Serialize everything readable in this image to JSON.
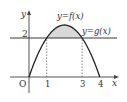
{
  "chart_data": {
    "type": "line",
    "title": "",
    "xlabel": "x",
    "ylabel": "y",
    "origin_label": "O",
    "x_ticks": [
      "1",
      "3",
      "4"
    ],
    "y_ticks": [
      "2"
    ],
    "xlim": [
      -1,
      4.6
    ],
    "ylim": [
      -0.8,
      3.4
    ],
    "series": [
      {
        "name": "y=f(x)",
        "label": "y=f(x)",
        "kind": "parabola",
        "formula": "f(x) = (2/3)x(4-x)",
        "x": [
          0,
          0.5,
          1,
          1.5,
          2,
          2.5,
          3,
          3.5,
          4
        ],
        "y": [
          0,
          1.1667,
          2,
          2.5,
          2.6667,
          2.5,
          2,
          1.1667,
          0
        ]
      },
      {
        "name": "y=g(x)",
        "label": "y=g(x)",
        "kind": "horizontal-line",
        "y_value": 2
      }
    ],
    "shaded_region": {
      "between": [
        "y=f(x)",
        "y=g(x)"
      ],
      "x_from": 1,
      "x_to": 3
    },
    "guide_lines": [
      {
        "x": 1,
        "from_y": 0,
        "to_y": 2,
        "style": "dashed"
      },
      {
        "x": 3,
        "from_y": 0,
        "to_y": 2,
        "style": "dashed"
      }
    ],
    "grid": false,
    "legend": "none",
    "colors": {
      "curve": "#222222",
      "shade": "#d9d9d9",
      "axis": "#444444"
    }
  }
}
